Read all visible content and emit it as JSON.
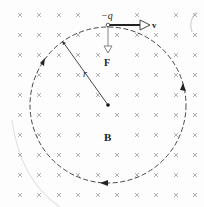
{
  "diagram": {
    "labels": {
      "charge": "−q",
      "velocity": "v",
      "force": "F",
      "radius": "r",
      "field": "B"
    },
    "field_marker": "×",
    "colors": {
      "background": "#fdfdfd",
      "grid_marker": "#a8a8a8",
      "path": "#333333",
      "vector": "#222222",
      "force_vector": "#888888"
    }
  }
}
